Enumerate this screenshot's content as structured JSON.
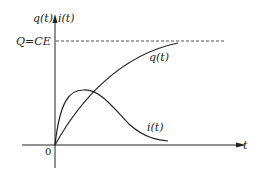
{
  "diagram": {
    "y_axis_label_q": "q(t)",
    "y_axis_label_i": "i(t)",
    "x_axis_label": "t",
    "origin_label": "0",
    "asymptote_label": "Q=CE",
    "curve_q_label": "q(t)",
    "curve_i_label": "i(t)",
    "line_color": "#222222"
  }
}
